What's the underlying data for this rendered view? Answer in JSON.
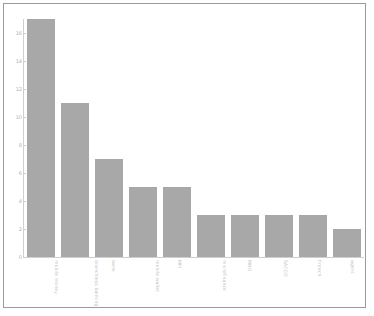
{
  "chart_data": {
    "type": "bar",
    "title": "",
    "subtitle": "",
    "xlabel": "",
    "ylabel": "",
    "grid": false,
    "legend": false,
    "legend_position": "none",
    "bar_color": "#a8a8a8",
    "axis_color": "#cfcfcf",
    "tick_label_color": "#b0b0b0",
    "background": "#ffffff",
    "frame_color": "#9a9a9a",
    "ylim": [
      0,
      17
    ],
    "ytick_values": [
      0,
      2,
      4,
      6,
      8,
      10,
      12,
      14,
      16
    ],
    "ytick_labels": [
      "0",
      "2",
      "4",
      "6",
      "8",
      "10",
      "12",
      "14",
      "16"
    ],
    "categories": [
      "mobile money",
      "branchless banking",
      "bank",
      "mobile wallet",
      "MFI",
      "microfinance",
      "MNO",
      "SACCO",
      "fintech",
      "agent"
    ],
    "values": [
      17,
      11,
      7,
      5,
      5,
      3,
      3,
      3,
      3,
      2
    ]
  }
}
